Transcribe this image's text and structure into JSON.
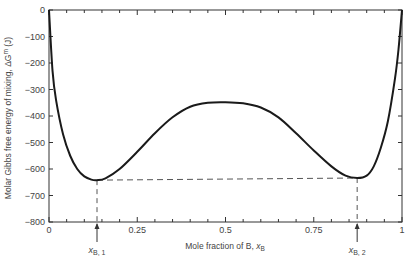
{
  "chart_data": {
    "type": "line",
    "title": "",
    "xlabel": "Mole fraction of B, x_B",
    "ylabel": "Molar Gibbs free energy of mixing, ΔG^m (J)",
    "xlim": [
      0,
      1
    ],
    "ylim": [
      -800,
      0
    ],
    "x_ticks": [
      0,
      0.25,
      0.5,
      0.75,
      1
    ],
    "x_tick_labels": [
      "0",
      "0.25",
      "0.5",
      "0.75",
      "1"
    ],
    "y_ticks": [
      0,
      -100,
      -200,
      -300,
      -400,
      -500,
      -600,
      -700,
      -800
    ],
    "y_tick_labels": [
      "0",
      "-100",
      "-200",
      "-300",
      "-400",
      "-500",
      "-600",
      "-700",
      "-800"
    ],
    "grid": false,
    "series": [
      {
        "name": "ΔG^m",
        "x": [
          0.0,
          0.01,
          0.02,
          0.04,
          0.06,
          0.08,
          0.1,
          0.12,
          0.136,
          0.16,
          0.2,
          0.25,
          0.3,
          0.35,
          0.4,
          0.45,
          0.5,
          0.55,
          0.6,
          0.65,
          0.7,
          0.75,
          0.8,
          0.84,
          0.873,
          0.9,
          0.92,
          0.94,
          0.96,
          0.98,
          0.99,
          1.0
        ],
        "values": [
          0,
          -230,
          -340,
          -470,
          -550,
          -600,
          -628,
          -640,
          -642,
          -635,
          -600,
          -535,
          -465,
          -405,
          -365,
          -350,
          -348,
          -352,
          -368,
          -405,
          -465,
          -530,
          -590,
          -625,
          -634,
          -625,
          -590,
          -520,
          -420,
          -260,
          -150,
          0
        ]
      }
    ],
    "annotations": [
      {
        "label": "x_B,1",
        "x": 0.136,
        "y": -642,
        "type": "arrow"
      },
      {
        "label": "x_B,2",
        "x": 0.873,
        "y": -634,
        "type": "arrow"
      },
      {
        "type": "dashed-common-tangent",
        "from": [
          0.136,
          -642
        ],
        "to": [
          0.873,
          -634
        ]
      }
    ]
  },
  "labels": {
    "xlabel_main": "Mole fraction of B, ",
    "xlabel_var": "x",
    "xlabel_sub": "B",
    "ylabel": "Molar Gibbs free energy of mixing, ΔG",
    "ylabel_sup": "m",
    "ylabel_unit": " (J)",
    "xb1_var": "x",
    "xb1_sub": "B, 1",
    "xb2_var": "x",
    "xb2_sub": "B, 2"
  }
}
